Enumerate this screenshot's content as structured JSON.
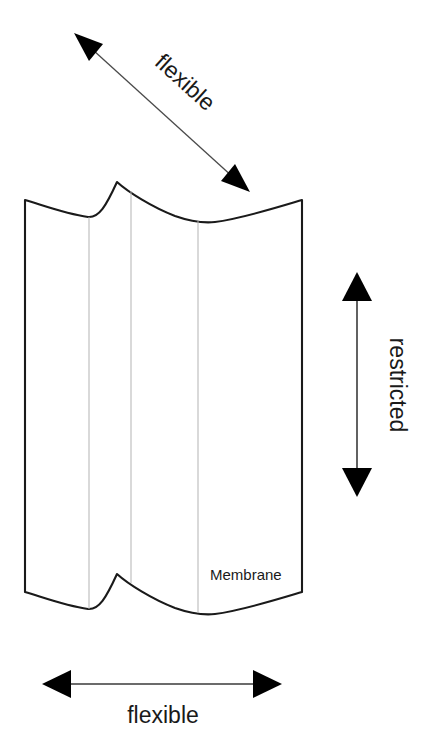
{
  "figure": {
    "type": "technical-diagram",
    "background_color": "#ffffff",
    "outline_color": "#1a1a1a",
    "crease_color": "#b3b3b3",
    "arrow_color": "#000000"
  },
  "annotations": {
    "diagonal_arrow": {
      "label": "flexible",
      "direction": "double-headed",
      "orientation": "diagonal",
      "rotation_deg": 43,
      "from": [
        74,
        33
      ],
      "to": [
        250,
        192
      ]
    },
    "vertical_arrow": {
      "label": "restricted",
      "direction": "double-headed",
      "orientation": "vertical",
      "rotation_deg": 90,
      "from": [
        357,
        272
      ],
      "to": [
        357,
        497
      ]
    },
    "horizontal_arrow": {
      "label": "flexible",
      "direction": "double-headed",
      "orientation": "horizontal",
      "rotation_deg": 0,
      "from": [
        42,
        684
      ],
      "to": [
        282,
        684
      ]
    }
  },
  "membrane": {
    "label": "Membrane",
    "left_edge_x": 25,
    "right_edge_x": 302,
    "top_edge_y": 200,
    "bottom_edge_y": 592,
    "crease_x_positions": [
      89,
      131,
      198
    ]
  }
}
